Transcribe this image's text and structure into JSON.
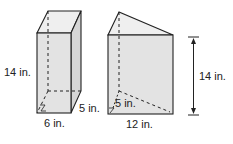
{
  "figures": [
    {
      "name": "rectangular-prism",
      "labels": {
        "height": "14 in.",
        "depth": "5 in.",
        "width": "6 in."
      }
    },
    {
      "name": "triangular-prism",
      "labels": {
        "height": "14 in.",
        "triangle_height": "5 in.",
        "base": "12 in."
      }
    }
  ],
  "colors": {
    "face": "#e6e6e6",
    "side": "#d9d9d9",
    "top": "#efefef",
    "stroke": "#222222"
  }
}
